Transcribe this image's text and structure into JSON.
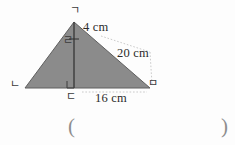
{
  "figure": {
    "shape_name": "triangle-with-altitude",
    "fill_color": "#8b8b8b",
    "stroke_color": "#5a5a5a",
    "background_color": "#fdfdfd",
    "leader_color": "#b4b4b4",
    "text_color": "#2b2b2b",
    "dimensions": {
      "altitude_upper": "4 cm",
      "hypotenuse": "20 cm",
      "base_right": "16 cm"
    },
    "vertices": {
      "apex": "ㄱ",
      "left": "ㄴ",
      "foot": "ㄷ",
      "right": "ㅁ",
      "altitude_mid": "ㄹ"
    }
  },
  "answer": {
    "open_paren": "(",
    "close_paren": ")",
    "value": ""
  }
}
